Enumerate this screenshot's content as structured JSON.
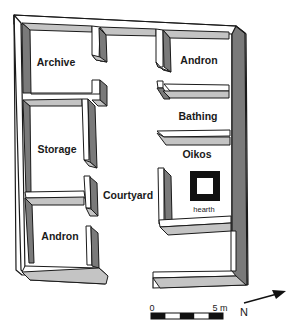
{
  "diagram": {
    "type": "architectural-floor-plan",
    "colors": {
      "wall_outline": "#1a1a1a",
      "wall_top": "#ffffff",
      "wall_side_dark": "#7a7a7a",
      "wall_side_light": "#c4c4c4",
      "hearth": "#111111",
      "background": "#ffffff"
    },
    "rooms": [
      {
        "id": "archive",
        "label": "Archive"
      },
      {
        "id": "andron-top",
        "label": "Andron"
      },
      {
        "id": "bathing",
        "label": "Bathing"
      },
      {
        "id": "storage",
        "label": "Storage"
      },
      {
        "id": "oikos",
        "label": "Oikos"
      },
      {
        "id": "courtyard",
        "label": "Courtyard"
      },
      {
        "id": "andron-bottom",
        "label": "Andron"
      }
    ],
    "features": {
      "hearth_label": "hearth"
    },
    "scale_bar": {
      "start_label": "0",
      "end_label": "5 m"
    },
    "north_arrow": {
      "label": "N"
    }
  }
}
